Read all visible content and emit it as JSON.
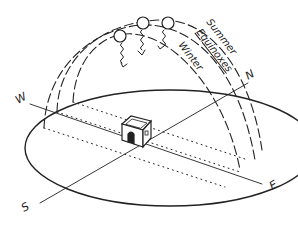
{
  "diagram": {
    "colors": {
      "ink": "#222222",
      "background": "#ffffff"
    },
    "paths": {
      "summer": {
        "label": "Summer"
      },
      "equinoxes": {
        "label": "Equinoxes"
      },
      "winter": {
        "label": "Winter"
      }
    },
    "compass": {
      "north": "N",
      "south": "S",
      "east": "E",
      "west": "W"
    },
    "suns": [
      {
        "name": "summer-sun"
      },
      {
        "name": "equinox-sun"
      },
      {
        "name": "winter-sun"
      }
    ],
    "house": {
      "name": "house"
    }
  }
}
